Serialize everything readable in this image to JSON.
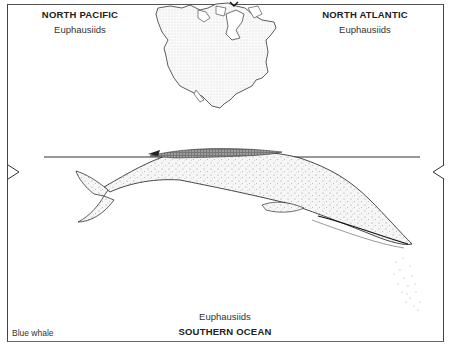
{
  "figure": {
    "species_label": "Blue whale",
    "regions": [
      {
        "name": "NORTH PACIFIC",
        "prey": "Euphausiids"
      },
      {
        "name": "NORTH ATLANTIC",
        "prey": "Euphausiids"
      },
      {
        "name": "SOUTHERN OCEAN",
        "prey": "Euphausiids"
      }
    ],
    "markers": {
      "left": "right-pointing-triangle",
      "right": "left-pointing-triangle"
    },
    "map": "north-america-outline",
    "caption_fragment": "lia   and   lakes   different  ... Waldo"
  }
}
